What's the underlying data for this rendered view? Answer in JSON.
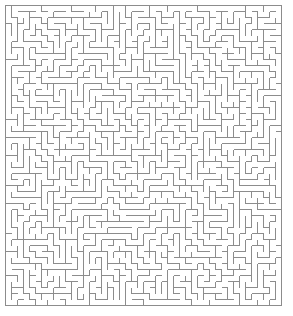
{
  "image": {
    "kind": "maze-puzzle",
    "width": 293,
    "height": 316,
    "background_color": "#ffffff",
    "alt_text": "Rectangular perfect maze drawn as thin gray lines on a white background"
  },
  "maze": {
    "type": "orthogonal-perfect-maze",
    "columns": 46,
    "rows": 50,
    "cell_size_px": 6,
    "origin_x_px": 5,
    "origin_y_px": 5,
    "grid_width_px": 276,
    "grid_height_px": 300,
    "wall_color": "#8c8c8c",
    "border_color": "#8c8c8c",
    "wall_thickness_px": 1,
    "background_color": "#ffffff",
    "has_outer_border": true,
    "entrance": "none-visible",
    "exit": "none-visible",
    "generation": {
      "algorithm": "randomized-depth-first-search",
      "seed": 20240517
    }
  },
  "labels": {
    "title": "",
    "caption": ""
  }
}
